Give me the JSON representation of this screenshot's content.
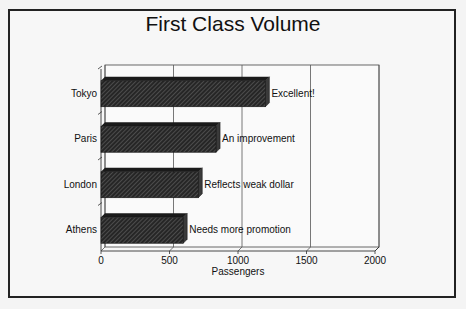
{
  "chart_data": {
    "type": "bar",
    "orientation": "horizontal",
    "title": "First Class Volume",
    "xlabel": "Passengers",
    "ylabel": "",
    "categories": [
      "Tokyo",
      "Paris",
      "London",
      "Athens"
    ],
    "values": [
      1200,
      840,
      710,
      600
    ],
    "annotations": [
      "Excellent!",
      "An improvement",
      "Reflects weak dollar",
      "Needs more promotion"
    ],
    "xlim": [
      0,
      2000
    ],
    "x_ticks": [
      0,
      500,
      1000,
      1500,
      2000
    ],
    "grid": true,
    "legend": "none",
    "style": "3d-hatched"
  },
  "colors": {
    "bar": "#2a2a2a",
    "hatch": "#6a6a6a",
    "grid": "#555555",
    "frame": "#222222"
  }
}
